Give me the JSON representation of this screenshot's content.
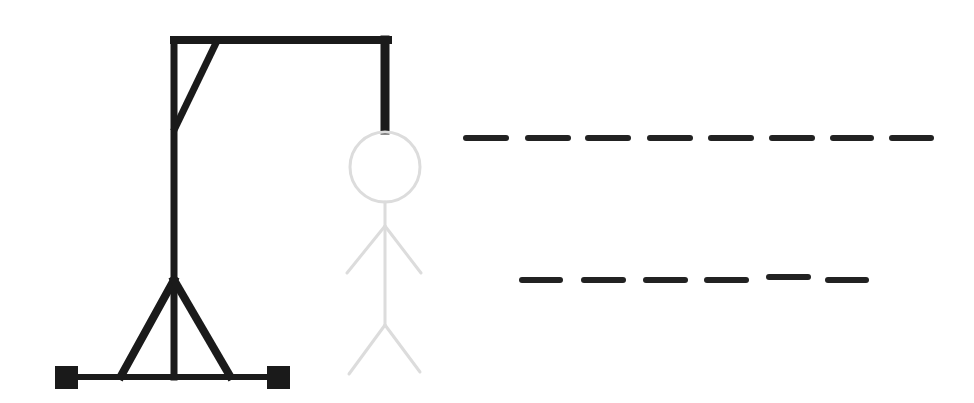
{
  "game": {
    "name": "Hangman",
    "colors": {
      "gallows": "#1a1a1a",
      "figure": "#dcdcdc",
      "blank": "#222222",
      "background": "#ffffff"
    },
    "word_rows": [
      {
        "length": 8,
        "letters": [
          "",
          "",
          "",
          "",
          "",
          "",
          "",
          ""
        ]
      },
      {
        "length": 6,
        "letters": [
          "",
          "",
          "",
          "",
          "",
          ""
        ]
      }
    ],
    "guessed_letters": ""
  }
}
